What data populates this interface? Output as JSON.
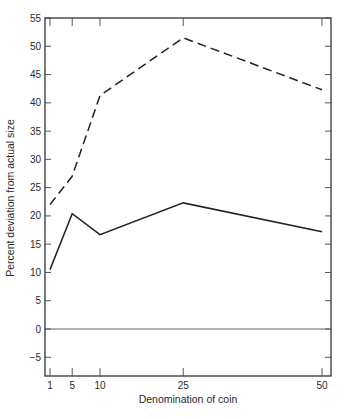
{
  "chart_data": {
    "type": "line",
    "title": "",
    "xlabel": "Denomination of coin",
    "ylabel": "Percent deviation from actual size",
    "x": [
      1,
      5,
      10,
      25,
      50
    ],
    "x_ticks": [
      1,
      5,
      10,
      25,
      50
    ],
    "y_ticks": [
      -5,
      0,
      5,
      10,
      15,
      20,
      25,
      30,
      35,
      40,
      45,
      50,
      55
    ],
    "xlim": [
      0,
      51.5
    ],
    "ylim": [
      -8.3,
      55
    ],
    "grid": false,
    "reference_line_y": 0,
    "legend": null,
    "series": [
      {
        "name": "dashed",
        "style": "dashed",
        "values": [
          22.0,
          27.0,
          41.3,
          51.5,
          42.3
        ]
      },
      {
        "name": "solid",
        "style": "solid",
        "values": [
          10.5,
          20.4,
          16.7,
          22.3,
          17.2
        ]
      }
    ]
  }
}
